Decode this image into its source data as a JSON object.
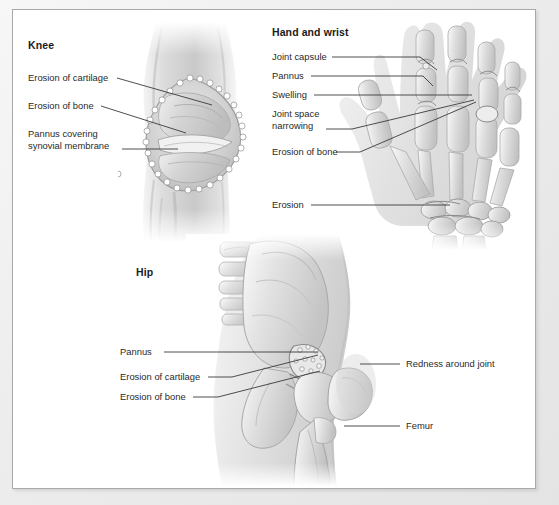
{
  "figure": {
    "background_color": "#ffffff",
    "frame_border_color": "#a9a9a9",
    "label_text_color": "#2a2a2a",
    "heading_text_color": "#1b1b1b",
    "leader_line_color": "#3a3a3a"
  },
  "panels": [
    {
      "id": "knee",
      "heading": "Knee",
      "heading_pos": {
        "x": 28,
        "y": 45
      },
      "artwork_name": "knee-joint-illustration",
      "labels": [
        {
          "name": "label-erosion-of-cartilage",
          "text": "Erosion of cartilage",
          "x": 28,
          "y": 78,
          "leader": [
            [
              117,
              82
            ],
            [
              212,
              108
            ]
          ]
        },
        {
          "name": "label-erosion-of-bone",
          "text": "Erosion of bone",
          "x": 28,
          "y": 106,
          "leader": [
            [
              101,
              110
            ],
            [
              180,
              135
            ]
          ]
        },
        {
          "name": "label-pannus-covering-synovial-membrane",
          "text": "Pannus covering\nsynovial membrane",
          "x": 28,
          "y": 134,
          "leader": [
            [
              122,
              152
            ],
            [
              175,
              152
            ]
          ]
        }
      ]
    },
    {
      "id": "hand-and-wrist",
      "heading": "Hand and wrist",
      "heading_pos": {
        "x": 272,
        "y": 32
      },
      "artwork_name": "hand-wrist-skeleton-illustration",
      "labels": [
        {
          "name": "label-joint-capsule",
          "text": "Joint capsule",
          "x": 272,
          "y": 57,
          "leader": [
            [
              330,
              61
            ],
            [
              424,
              61
            ],
            [
              438,
              72
            ]
          ]
        },
        {
          "name": "label-pannus",
          "text": "Pannus",
          "x": 272,
          "y": 76,
          "leader": [
            [
              310,
              80
            ],
            [
              425,
              80
            ],
            [
              434,
              88
            ]
          ]
        },
        {
          "name": "label-swelling",
          "text": "Swelling",
          "x": 272,
          "y": 95,
          "leader": [
            [
              314,
              99
            ],
            [
              473,
              99
            ]
          ]
        },
        {
          "name": "label-joint-space-narrowing",
          "text": "Joint space\nnarrowing",
          "x": 272,
          "y": 114,
          "leader": [
            [
              325,
              133
            ],
            [
              473,
              104
            ]
          ]
        },
        {
          "name": "label-erosion-of-bone-hand",
          "text": "Erosion of bone",
          "x": 272,
          "y": 152,
          "leader": [
            [
              334,
              156
            ],
            [
              474,
              106
            ]
          ]
        },
        {
          "name": "label-erosion-wrist",
          "text": "Erosion",
          "x": 272,
          "y": 205,
          "leader": [
            [
              310,
              209
            ],
            [
              447,
              209
            ]
          ]
        }
      ]
    },
    {
      "id": "hip",
      "heading": "Hip",
      "heading_pos": {
        "x": 136,
        "y": 272
      },
      "artwork_name": "hip-joint-illustration",
      "labels": [
        {
          "name": "label-pannus-hip",
          "text": "Pannus",
          "x": 120,
          "y": 352,
          "leader": [
            [
              163,
              356
            ],
            [
              318,
              356
            ]
          ]
        },
        {
          "name": "label-erosion-of-cartilage-hip",
          "text": "Erosion of cartilage",
          "x": 120,
          "y": 377,
          "leader": [
            [
              207,
              381
            ],
            [
              228,
              381
            ],
            [
              318,
              358
            ]
          ]
        },
        {
          "name": "label-erosion-of-bone-hip",
          "text": "Erosion of bone",
          "x": 120,
          "y": 397,
          "leader": [
            [
              192,
              401
            ],
            [
              215,
              401
            ],
            [
              318,
              374
            ]
          ]
        },
        {
          "name": "label-redness-around-joint",
          "text": "Redness around joint",
          "x": 404,
          "y": 364,
          "leader": [
            [
              398,
              368
            ],
            [
              361,
              368
            ]
          ]
        },
        {
          "name": "label-femur",
          "text": "Femur",
          "x": 404,
          "y": 426,
          "leader": [
            [
              398,
              430
            ],
            [
              343,
              430
            ]
          ]
        }
      ]
    }
  ]
}
